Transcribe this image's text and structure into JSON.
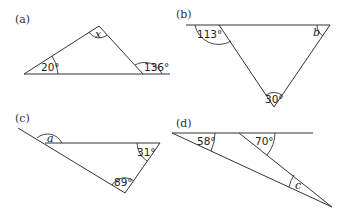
{
  "diagrams": {
    "a": {
      "label": "(a)",
      "angles": {
        "left": "20°",
        "apex": "x",
        "exterior_right": "136°"
      }
    },
    "b": {
      "label": "(b)",
      "angles": {
        "exterior_left": "113°",
        "right": "b",
        "bottom": "30°"
      }
    },
    "c": {
      "label": "(c)",
      "angles": {
        "exterior_left": "a",
        "right": "31°",
        "bottom": "89°"
      }
    },
    "d": {
      "label": "(d)",
      "angles": {
        "left": "58°",
        "exterior_middle": "70°",
        "bottom": "c"
      }
    }
  }
}
